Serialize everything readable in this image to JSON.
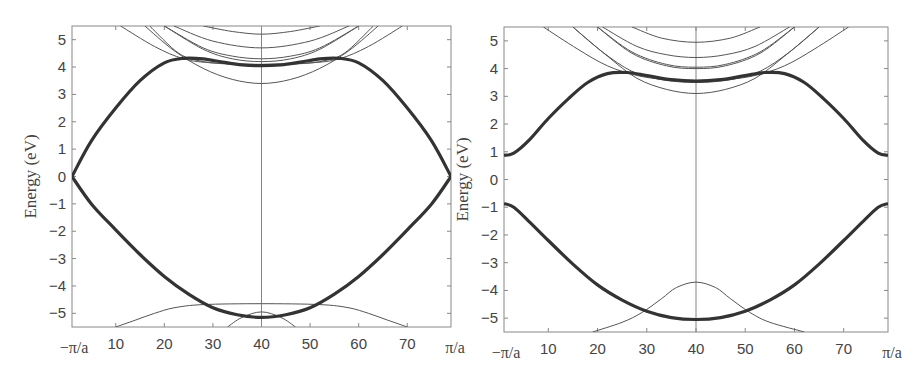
{
  "chart_data": [
    {
      "type": "line",
      "title": "",
      "xlabel": "",
      "ylabel": "Energy (eV)",
      "xlim": [
        1,
        79
      ],
      "ylim": [
        -5.5,
        5.5
      ],
      "grid": false,
      "x_ticks": [
        10,
        20,
        30,
        40,
        50,
        60,
        70
      ],
      "x_tick_labels": [
        "10",
        "20",
        "30",
        "40",
        "50",
        "60",
        "70"
      ],
      "x_edge_labels": [
        "−π/a",
        "π/a"
      ],
      "y_ticks": [
        5,
        4,
        3,
        2,
        1,
        0,
        -1,
        -2,
        -3,
        -4,
        -5
      ],
      "y_tick_labels": [
        "5",
        "4",
        "3",
        "2",
        "1",
        "0",
        "−1",
        "−2",
        "−3",
        "−4",
        "−5"
      ],
      "vertical_line_x": 40,
      "series": [
        {
          "name": "upper-band-thick",
          "weight": "thick",
          "points": [
            [
              1,
              0
            ],
            [
              5,
              1.3
            ],
            [
              10,
              2.5
            ],
            [
              15,
              3.5
            ],
            [
              20,
              4.15
            ],
            [
              24,
              4.32
            ],
            [
              28,
              4.3
            ],
            [
              32,
              4.18
            ],
            [
              36,
              4.08
            ],
            [
              40,
              4.05
            ],
            [
              44,
              4.08
            ],
            [
              48,
              4.18
            ],
            [
              52,
              4.3
            ],
            [
              56,
              4.32
            ],
            [
              60,
              4.15
            ],
            [
              65,
              3.5
            ],
            [
              70,
              2.5
            ],
            [
              75,
              1.3
            ],
            [
              79,
              0
            ]
          ]
        },
        {
          "name": "lower-band-thick",
          "weight": "thick",
          "points": [
            [
              1,
              0
            ],
            [
              5,
              -1.0
            ],
            [
              10,
              -1.95
            ],
            [
              15,
              -2.85
            ],
            [
              20,
              -3.65
            ],
            [
              25,
              -4.3
            ],
            [
              30,
              -4.8
            ],
            [
              35,
              -5.05
            ],
            [
              40,
              -5.15
            ],
            [
              45,
              -5.05
            ],
            [
              50,
              -4.8
            ],
            [
              55,
              -4.3
            ],
            [
              60,
              -3.65
            ],
            [
              65,
              -2.85
            ],
            [
              70,
              -1.95
            ],
            [
              75,
              -1.0
            ],
            [
              79,
              0
            ]
          ]
        },
        {
          "name": "upper-thin-1",
          "weight": "thin",
          "points": [
            [
              28,
              5.5
            ],
            [
              34,
              5.3
            ],
            [
              40,
              5.2
            ],
            [
              46,
              5.3
            ],
            [
              52,
              5.5
            ]
          ]
        },
        {
          "name": "upper-thin-2",
          "weight": "thin",
          "points": [
            [
              22,
              5.5
            ],
            [
              30,
              4.95
            ],
            [
              40,
              4.7
            ],
            [
              50,
              4.95
            ],
            [
              58,
              5.5
            ]
          ]
        },
        {
          "name": "upper-thin-3",
          "weight": "thin",
          "points": [
            [
              20,
              5.5
            ],
            [
              28,
              4.7
            ],
            [
              34,
              4.4
            ],
            [
              40,
              4.3
            ],
            [
              46,
              4.4
            ],
            [
              52,
              4.7
            ],
            [
              60,
              5.5
            ]
          ]
        },
        {
          "name": "upper-thin-4",
          "weight": "thin",
          "points": [
            [
              20,
              5.5
            ],
            [
              28,
              4.65
            ],
            [
              34,
              4.3
            ],
            [
              40,
              4.2
            ],
            [
              46,
              4.3
            ],
            [
              52,
              4.65
            ],
            [
              60,
              5.5
            ]
          ]
        },
        {
          "name": "upper-thin-5",
          "weight": "thin",
          "points": [
            [
              16,
              5.5
            ],
            [
              22,
              4.6
            ],
            [
              28,
              3.95
            ],
            [
              34,
              3.55
            ],
            [
              40,
              3.4
            ],
            [
              46,
              3.55
            ],
            [
              52,
              3.95
            ],
            [
              58,
              4.6
            ],
            [
              64,
              5.5
            ]
          ]
        },
        {
          "name": "upper-thin-6",
          "weight": "thin",
          "points": [
            [
              11,
              5.5
            ],
            [
              18,
              4.75
            ],
            [
              24,
              4.3
            ],
            [
              30,
              4.15
            ],
            [
              40,
              4.1
            ],
            [
              50,
              4.15
            ],
            [
              56,
              4.3
            ],
            [
              62,
              4.75
            ],
            [
              69,
              5.5
            ]
          ]
        },
        {
          "name": "upper-thin-7",
          "weight": "thin",
          "points": [
            [
              17,
              5.5
            ],
            [
              23,
              4.5
            ],
            [
              28,
              4.2
            ],
            [
              34,
              4.1
            ],
            [
              40,
              4.05
            ],
            [
              46,
              4.1
            ],
            [
              52,
              4.2
            ],
            [
              57,
              4.5
            ],
            [
              63,
              5.5
            ]
          ]
        },
        {
          "name": "lower-thin-flat",
          "weight": "thin",
          "points": [
            [
              10,
              -5.5
            ],
            [
              14,
              -5.25
            ],
            [
              18,
              -5.0
            ],
            [
              22,
              -4.8
            ],
            [
              28,
              -4.68
            ],
            [
              40,
              -4.65
            ],
            [
              52,
              -4.68
            ],
            [
              58,
              -4.8
            ],
            [
              62,
              -5.0
            ],
            [
              66,
              -5.25
            ],
            [
              70,
              -5.5
            ]
          ]
        },
        {
          "name": "lower-thin-arc",
          "weight": "thin",
          "points": [
            [
              33,
              -5.5
            ],
            [
              36,
              -5.15
            ],
            [
              40,
              -4.95
            ],
            [
              44,
              -5.15
            ],
            [
              47,
              -5.5
            ]
          ]
        }
      ]
    },
    {
      "type": "line",
      "title": "",
      "xlabel": "",
      "ylabel": "Energy (eV)",
      "xlim": [
        1,
        79
      ],
      "ylim": [
        -5.5,
        5.5
      ],
      "grid": false,
      "x_ticks": [
        10,
        20,
        30,
        40,
        50,
        60,
        70
      ],
      "x_tick_labels": [
        "10",
        "20",
        "30",
        "40",
        "50",
        "60",
        "70"
      ],
      "x_edge_labels": [
        "−π/a",
        "π/a"
      ],
      "y_ticks": [
        5,
        4,
        3,
        2,
        1,
        0,
        -1,
        -2,
        -3,
        -4,
        -5
      ],
      "y_tick_labels": [
        "5",
        "4",
        "3",
        "2",
        "1",
        "0",
        "−1",
        "−2",
        "−3",
        "−4",
        "−5"
      ],
      "vertical_line_x": 40,
      "series": [
        {
          "name": "conduction-band-thick",
          "weight": "thick",
          "points": [
            [
              1,
              0.87
            ],
            [
              3,
              0.95
            ],
            [
              6,
              1.4
            ],
            [
              10,
              2.2
            ],
            [
              14,
              2.9
            ],
            [
              18,
              3.5
            ],
            [
              22,
              3.82
            ],
            [
              26,
              3.86
            ],
            [
              30,
              3.75
            ],
            [
              35,
              3.6
            ],
            [
              40,
              3.55
            ],
            [
              45,
              3.6
            ],
            [
              50,
              3.75
            ],
            [
              54,
              3.86
            ],
            [
              58,
              3.82
            ],
            [
              62,
              3.5
            ],
            [
              66,
              2.9
            ],
            [
              70,
              2.2
            ],
            [
              74,
              1.4
            ],
            [
              77,
              0.95
            ],
            [
              79,
              0.87
            ]
          ]
        },
        {
          "name": "valence-band-thick",
          "weight": "thick",
          "points": [
            [
              1,
              -0.87
            ],
            [
              3,
              -1.0
            ],
            [
              6,
              -1.5
            ],
            [
              10,
              -2.2
            ],
            [
              15,
              -3.05
            ],
            [
              20,
              -3.8
            ],
            [
              25,
              -4.35
            ],
            [
              30,
              -4.75
            ],
            [
              35,
              -4.98
            ],
            [
              40,
              -5.05
            ],
            [
              45,
              -4.98
            ],
            [
              50,
              -4.75
            ],
            [
              55,
              -4.35
            ],
            [
              60,
              -3.8
            ],
            [
              65,
              -3.05
            ],
            [
              70,
              -2.2
            ],
            [
              74,
              -1.5
            ],
            [
              77,
              -1.0
            ],
            [
              79,
              -0.87
            ]
          ]
        },
        {
          "name": "upper-thin-1",
          "weight": "thin",
          "points": [
            [
              27,
              5.5
            ],
            [
              33,
              5.1
            ],
            [
              40,
              4.95
            ],
            [
              47,
              5.1
            ],
            [
              53,
              5.5
            ]
          ]
        },
        {
          "name": "upper-thin-2",
          "weight": "thin",
          "points": [
            [
              21,
              5.5
            ],
            [
              28,
              4.8
            ],
            [
              34,
              4.5
            ],
            [
              40,
              4.4
            ],
            [
              46,
              4.5
            ],
            [
              52,
              4.8
            ],
            [
              59,
              5.5
            ]
          ]
        },
        {
          "name": "upper-thin-3",
          "weight": "thin",
          "points": [
            [
              20,
              5.5
            ],
            [
              27,
              4.6
            ],
            [
              34,
              4.15
            ],
            [
              40,
              4.05
            ],
            [
              46,
              4.15
            ],
            [
              53,
              4.6
            ],
            [
              60,
              5.5
            ]
          ]
        },
        {
          "name": "upper-thin-4",
          "weight": "thin",
          "points": [
            [
              20,
              5.5
            ],
            [
              27,
              4.55
            ],
            [
              34,
              4.1
            ],
            [
              40,
              4.0
            ],
            [
              46,
              4.1
            ],
            [
              53,
              4.55
            ],
            [
              60,
              5.5
            ]
          ]
        },
        {
          "name": "upper-thin-5",
          "weight": "thin",
          "points": [
            [
              15,
              5.5
            ],
            [
              22,
              4.45
            ],
            [
              28,
              3.65
            ],
            [
              34,
              3.25
            ],
            [
              40,
              3.1
            ],
            [
              46,
              3.25
            ],
            [
              52,
              3.65
            ],
            [
              58,
              4.45
            ],
            [
              65,
              5.5
            ]
          ]
        },
        {
          "name": "upper-thin-6",
          "weight": "thin",
          "points": [
            [
              9,
              5.5
            ],
            [
              16,
              4.7
            ],
            [
              22,
              4.1
            ],
            [
              28,
              3.75
            ],
            [
              34,
              3.6
            ],
            [
              40,
              3.55
            ],
            [
              46,
              3.6
            ],
            [
              52,
              3.75
            ],
            [
              58,
              4.1
            ],
            [
              64,
              4.7
            ],
            [
              71,
              5.5
            ]
          ]
        },
        {
          "name": "upper-thin-7",
          "weight": "thin",
          "points": [
            [
              15,
              5.5
            ],
            [
              21,
              4.6
            ],
            [
              27,
              3.9
            ],
            [
              33,
              3.6
            ],
            [
              40,
              3.5
            ],
            [
              47,
              3.6
            ],
            [
              53,
              3.9
            ],
            [
              59,
              4.6
            ],
            [
              65,
              5.5
            ]
          ]
        },
        {
          "name": "lower-thin-bell",
          "weight": "thin",
          "points": [
            [
              19,
              -5.5
            ],
            [
              25,
              -5.15
            ],
            [
              29,
              -4.8
            ],
            [
              33,
              -4.3
            ],
            [
              36,
              -3.9
            ],
            [
              40,
              -3.7
            ],
            [
              44,
              -3.9
            ],
            [
              47,
              -4.3
            ],
            [
              51,
              -4.8
            ],
            [
              55,
              -5.15
            ],
            [
              62,
              -5.5
            ]
          ]
        }
      ]
    }
  ]
}
